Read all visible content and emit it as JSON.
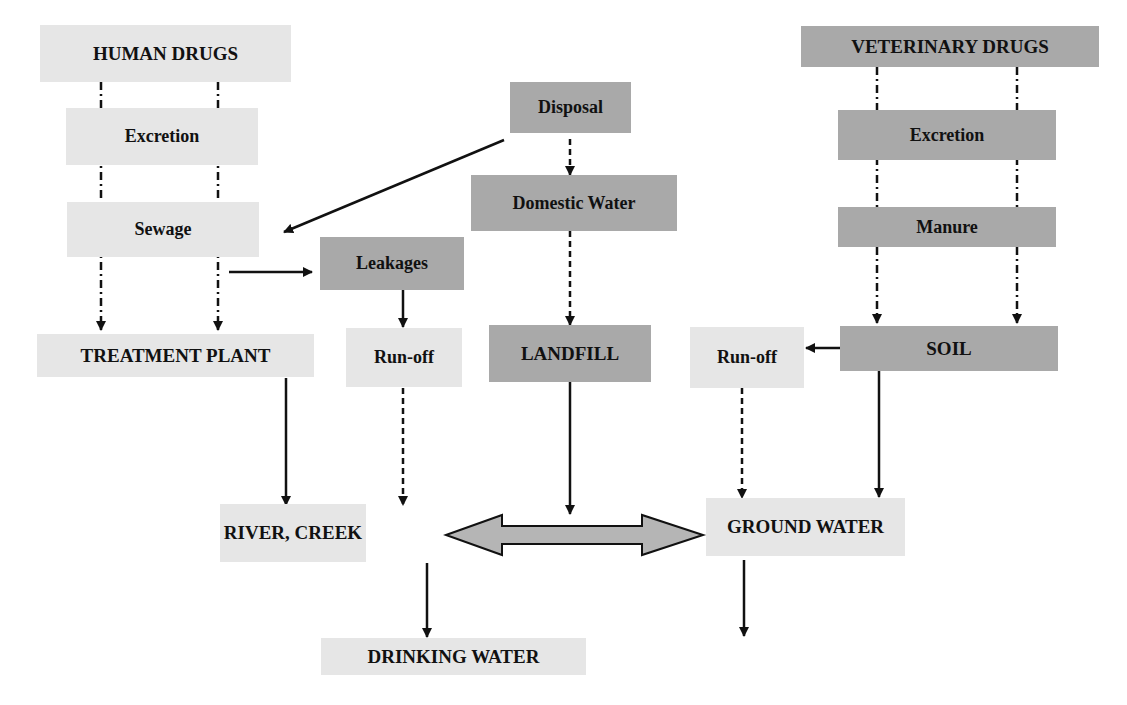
{
  "diagram": {
    "colors": {
      "light_box": "#e6e6e6",
      "dark_box": "#a9a9a9",
      "arrow": "#111111",
      "double_arrow_fill": "#b5b5b5"
    },
    "nodes": {
      "human_drugs": "HUMAN DRUGS",
      "human_excretion": "Excretion",
      "sewage": "Sewage",
      "treatment_plant": "TREATMENT PLANT",
      "disposal": "Disposal",
      "domestic_water": "Domestic Water",
      "leakages": "Leakages",
      "runoff_left": "Run-off",
      "landfill": "LANDFILL",
      "veterinary_drugs": "VETERINARY DRUGS",
      "vet_excretion": "Excretion",
      "manure": "Manure",
      "soil": "SOIL",
      "runoff_right": "Run-off",
      "river_creek": "RIVER, CREEK",
      "ground_water": "GROUND WATER",
      "drinking_water": "DRINKING WATER"
    },
    "edges": [
      {
        "from": "human_drugs",
        "to": "treatment_plant",
        "style": "dash-dot",
        "count": 2
      },
      {
        "from": "disposal",
        "to": "sewage",
        "style": "solid"
      },
      {
        "from": "disposal",
        "to": "domestic_water",
        "style": "dashed"
      },
      {
        "from": "domestic_water",
        "to": "landfill",
        "style": "dashed"
      },
      {
        "from": "sewage",
        "to": "leakages",
        "style": "solid"
      },
      {
        "from": "leakages",
        "to": "runoff_left",
        "style": "solid"
      },
      {
        "from": "veterinary_drugs",
        "to": "soil",
        "style": "dash-dot",
        "count": 2
      },
      {
        "from": "soil",
        "to": "runoff_right",
        "style": "solid"
      },
      {
        "from": "treatment_plant",
        "to": "river_creek",
        "style": "solid"
      },
      {
        "from": "runoff_left",
        "to": "river_creek",
        "style": "dashed"
      },
      {
        "from": "landfill",
        "to": "double_arrow",
        "style": "solid"
      },
      {
        "from": "runoff_right",
        "to": "ground_water",
        "style": "dashed"
      },
      {
        "from": "soil",
        "to": "ground_water",
        "style": "solid"
      },
      {
        "from": "river_creek",
        "to": "ground_water",
        "style": "double-headed"
      },
      {
        "from": "river_creek",
        "to": "drinking_water",
        "style": "solid"
      },
      {
        "from": "ground_water",
        "to": "drinking_water",
        "style": "solid"
      }
    ]
  }
}
